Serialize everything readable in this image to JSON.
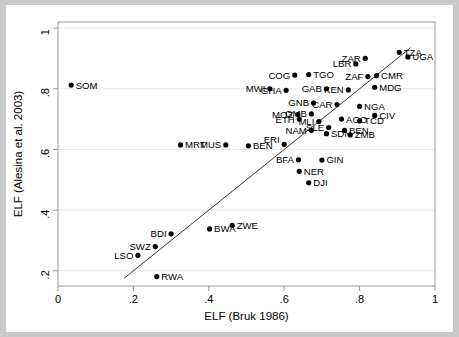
{
  "chart_data": {
    "type": "scatter",
    "title": "",
    "xlabel": "ELF (Bruk 1986)",
    "ylabel": "ELF (Alesina et al. 2003)",
    "xlim": [
      0,
      1
    ],
    "ylim": [
      0.15,
      1.02
    ],
    "xticks": [
      "0",
      ".2",
      ".4",
      ".6",
      ".8",
      "1"
    ],
    "xtick_values": [
      0,
      0.2,
      0.4,
      0.6,
      0.8,
      1
    ],
    "yticks": [
      ".2",
      ".4",
      ".6",
      ".8",
      "1"
    ],
    "ytick_values": [
      0.2,
      0.4,
      0.6,
      0.8,
      1
    ],
    "grid": true,
    "legend": "none",
    "fit_line": {
      "label": "45-degree reference line",
      "x0": 0.175,
      "y0": 0.175,
      "x1": 0.935,
      "y1": 0.935
    },
    "points": [
      {
        "label": "SOM",
        "x": 0.035,
        "y": 0.812,
        "label_pos": "right"
      },
      {
        "label": "MRT",
        "x": 0.325,
        "y": 0.615,
        "label_pos": "right"
      },
      {
        "label": "MUS",
        "x": 0.445,
        "y": 0.615,
        "label_pos": "left"
      },
      {
        "label": "BEN",
        "x": 0.505,
        "y": 0.612,
        "label_pos": "right"
      },
      {
        "label": "ERI",
        "x": 0.6,
        "y": 0.617,
        "label_pos": "upleft"
      },
      {
        "label": "BFA",
        "x": 0.638,
        "y": 0.566,
        "label_pos": "left"
      },
      {
        "label": "GIN",
        "x": 0.7,
        "y": 0.565,
        "label_pos": "right"
      },
      {
        "label": "NER",
        "x": 0.64,
        "y": 0.528,
        "label_pos": "right"
      },
      {
        "label": "DJI",
        "x": 0.665,
        "y": 0.49,
        "label_pos": "right"
      },
      {
        "label": "MWI",
        "x": 0.562,
        "y": 0.8,
        "label_pos": "left"
      },
      {
        "label": "GHA",
        "x": 0.605,
        "y": 0.795,
        "label_pos": "left"
      },
      {
        "label": "COG",
        "x": 0.628,
        "y": 0.845,
        "label_pos": "left"
      },
      {
        "label": "TGO",
        "x": 0.665,
        "y": 0.847,
        "label_pos": "right"
      },
      {
        "label": "GAB",
        "x": 0.712,
        "y": 0.8,
        "label_pos": "left"
      },
      {
        "label": "KEN",
        "x": 0.77,
        "y": 0.796,
        "label_pos": "left"
      },
      {
        "label": "GNB",
        "x": 0.678,
        "y": 0.753,
        "label_pos": "left"
      },
      {
        "label": "MOZ",
        "x": 0.636,
        "y": 0.715,
        "label_pos": "left"
      },
      {
        "label": "GMB",
        "x": 0.672,
        "y": 0.717,
        "label_pos": "left"
      },
      {
        "label": "CAR",
        "x": 0.74,
        "y": 0.748,
        "label_pos": "left"
      },
      {
        "label": "ETH",
        "x": 0.64,
        "y": 0.7,
        "label_pos": "left"
      },
      {
        "label": "MLI",
        "x": 0.692,
        "y": 0.692,
        "label_pos": "left"
      },
      {
        "label": "AGO",
        "x": 0.752,
        "y": 0.7,
        "label_pos": "right"
      },
      {
        "label": "TCD",
        "x": 0.8,
        "y": 0.694,
        "label_pos": "right"
      },
      {
        "label": "NGA",
        "x": 0.8,
        "y": 0.742,
        "label_pos": "right"
      },
      {
        "label": "CIV",
        "x": 0.84,
        "y": 0.712,
        "label_pos": "right"
      },
      {
        "label": "NAM",
        "x": 0.672,
        "y": 0.663,
        "label_pos": "left"
      },
      {
        "label": "SLE",
        "x": 0.718,
        "y": 0.672,
        "label_pos": "left"
      },
      {
        "label": "SDN",
        "x": 0.712,
        "y": 0.652,
        "label_pos": "right"
      },
      {
        "label": "BEN2",
        "x": 0.76,
        "y": 0.663,
        "label_pos": "right"
      },
      {
        "label": "ZMB",
        "x": 0.775,
        "y": 0.648,
        "label_pos": "right"
      },
      {
        "label": "LBR",
        "x": 0.79,
        "y": 0.882,
        "label_pos": "left"
      },
      {
        "label": "ZAR",
        "x": 0.815,
        "y": 0.9,
        "label_pos": "left"
      },
      {
        "label": "ZAF",
        "x": 0.822,
        "y": 0.84,
        "label_pos": "left"
      },
      {
        "label": "CMR",
        "x": 0.845,
        "y": 0.843,
        "label_pos": "right"
      },
      {
        "label": "MDG",
        "x": 0.84,
        "y": 0.805,
        "label_pos": "right"
      },
      {
        "label": "TZA",
        "x": 0.905,
        "y": 0.92,
        "label_pos": "right"
      },
      {
        "label": "UGA",
        "x": 0.928,
        "y": 0.905,
        "label_pos": "right"
      }
    ],
    "note_labels": [
      "SOM",
      "MRT",
      "MUS",
      "BEN",
      "ERI",
      "BFA",
      "GIN",
      "NER",
      "DJI",
      "MWI",
      "GHA",
      "COG",
      "TGO",
      "GAB",
      "KEN",
      "GNB",
      "MOZ",
      "GMB",
      "CAR",
      "ETH",
      "MLI",
      "AGO",
      "TCD",
      "NGA",
      "CIV",
      "NAM",
      "SLE",
      "SDN",
      "BEN",
      "ZMB",
      "LBR",
      "ZAR",
      "ZAF",
      "CMR",
      "MDG",
      "TZA",
      "UGA",
      "LSO",
      "SWZ",
      "BDI",
      "RWA",
      "BWA",
      "ZWE"
    ]
  },
  "extra_points": [
    {
      "label": "LSO",
      "x": 0.212,
      "y": 0.251,
      "label_pos": "left"
    },
    {
      "label": "SWZ",
      "x": 0.258,
      "y": 0.28,
      "label_pos": "left"
    },
    {
      "label": "BDI",
      "x": 0.3,
      "y": 0.322,
      "label_pos": "left"
    },
    {
      "label": "RWA",
      "x": 0.262,
      "y": 0.181,
      "label_pos": "right"
    },
    {
      "label": "BWA",
      "x": 0.402,
      "y": 0.338,
      "label_pos": "right"
    },
    {
      "label": "ZWE",
      "x": 0.462,
      "y": 0.35,
      "label_pos": "right"
    }
  ],
  "colors": {
    "background": "#c9c9c9",
    "figure": "#ffffff",
    "marker": "#000000",
    "frame": "#9a9a9a",
    "grid": "#e8e8e8",
    "fitline": "#3a3a3a"
  }
}
